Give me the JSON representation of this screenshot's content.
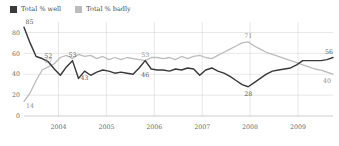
{
  "legend": {
    "items": [
      {
        "label": "Total % well",
        "color": "#3a3a3a",
        "key": "well"
      },
      {
        "label": "Total % badly",
        "color": "#bcbcbc",
        "key": "badly"
      }
    ]
  },
  "axes": {
    "y_ticks": [
      "0",
      "20",
      "40",
      "60",
      "80"
    ],
    "x_ticks": [
      "2004",
      "2005",
      "2006",
      "2007",
      "2008",
      "2009"
    ]
  },
  "annotations": {
    "well_start": "85",
    "well_52": "52",
    "well_53": "53",
    "well_43": "43",
    "well_46": "46",
    "well_28": "28",
    "well_end": "56",
    "badly_start": "14",
    "badly_47": "47",
    "badly_53": "53",
    "badly_71": "71",
    "badly_end": "40"
  },
  "chart_data": {
    "type": "line",
    "title": "",
    "xlabel": "",
    "ylabel": "",
    "ylim": [
      0,
      90
    ],
    "grid": true,
    "legend_position": "top-left",
    "x_tick_labels": [
      "2004",
      "2005",
      "2006",
      "2007",
      "2008",
      "2009"
    ],
    "y_tick_values": [
      0,
      20,
      40,
      60,
      80
    ],
    "series": [
      {
        "name": "Total % well",
        "color": "#3a3a3a",
        "values": [
          85,
          70,
          57,
          55,
          52,
          45,
          39,
          47,
          53,
          36,
          43,
          39,
          42,
          44,
          43,
          41,
          42,
          41,
          40,
          46,
          53,
          45,
          44,
          44,
          43,
          45,
          44,
          46,
          45,
          39,
          44,
          46,
          43,
          41,
          38,
          34,
          30,
          28,
          32,
          36,
          40,
          43,
          44,
          45,
          46,
          49,
          53,
          53,
          53,
          53,
          54,
          56
        ],
        "labeled_points": [
          {
            "index": 0,
            "value": 85
          },
          {
            "index": 4,
            "value": 52
          },
          {
            "index": 8,
            "value": 53
          },
          {
            "index": 10,
            "value": 43
          },
          {
            "index": 20,
            "value": 46
          },
          {
            "index": 37,
            "value": 28
          },
          {
            "index": 51,
            "value": 56
          }
        ]
      },
      {
        "name": "Total % badly",
        "color": "#bcbcbc",
        "values": [
          14,
          22,
          34,
          44,
          47,
          50,
          56,
          58,
          55,
          59,
          57,
          58,
          55,
          57,
          54,
          56,
          54,
          56,
          55,
          54,
          53,
          56,
          56,
          55,
          56,
          54,
          57,
          55,
          57,
          58,
          56,
          55,
          58,
          61,
          64,
          67,
          70,
          71,
          67,
          64,
          61,
          59,
          57,
          55,
          53,
          51,
          49,
          47,
          45,
          44,
          42,
          40
        ],
        "labeled_points": [
          {
            "index": 0,
            "value": 14
          },
          {
            "index": 4,
            "value": 47
          },
          {
            "index": 20,
            "value": 53
          },
          {
            "index": 37,
            "value": 71
          },
          {
            "index": 51,
            "value": 40
          }
        ]
      }
    ]
  }
}
